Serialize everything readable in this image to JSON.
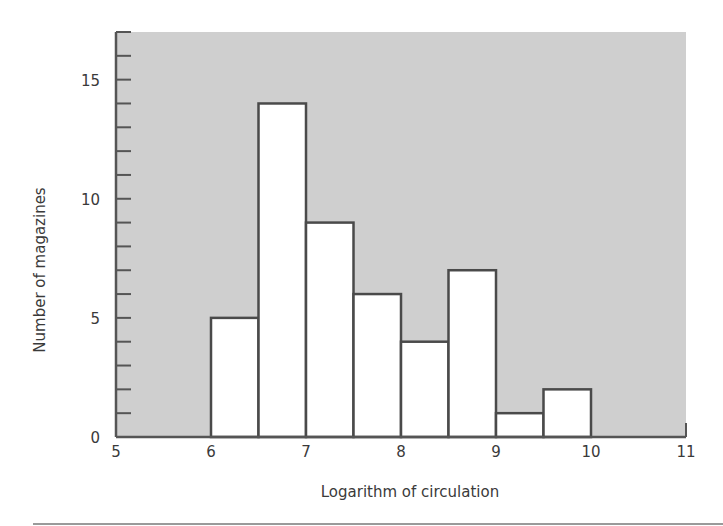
{
  "chart_data": {
    "type": "bar",
    "subtype": "histogram",
    "title": "",
    "xlabel": "Logarithm of circulation",
    "ylabel": "Number of magazines",
    "xlim": [
      5,
      11
    ],
    "ylim": [
      0,
      17
    ],
    "x_ticks": [
      5,
      6,
      7,
      8,
      9,
      10,
      11
    ],
    "y_tick_labels": [
      0,
      5,
      10,
      15
    ],
    "y_minor_tick_step": 1,
    "bin_width": 0.5,
    "bins": [
      {
        "start": 6.0,
        "end": 6.5,
        "count": 5
      },
      {
        "start": 6.5,
        "end": 7.0,
        "count": 14
      },
      {
        "start": 7.0,
        "end": 7.5,
        "count": 9
      },
      {
        "start": 7.5,
        "end": 8.0,
        "count": 6
      },
      {
        "start": 8.0,
        "end": 8.5,
        "count": 4
      },
      {
        "start": 8.5,
        "end": 9.0,
        "count": 7
      },
      {
        "start": 9.0,
        "end": 9.5,
        "count": 1
      },
      {
        "start": 9.5,
        "end": 10.0,
        "count": 2
      }
    ],
    "categories": [
      "6.0-6.5",
      "6.5-7.0",
      "7.0-7.5",
      "7.5-8.0",
      "8.0-8.5",
      "8.5-9.0",
      "9.0-9.5",
      "9.5-10.0"
    ],
    "values": [
      5,
      14,
      9,
      6,
      4,
      7,
      1,
      2
    ],
    "grid": false,
    "legend": null,
    "colors": {
      "plot_background": "#cfcfcf",
      "bar_fill": "#ffffff",
      "bar_edge": "#4a4a4a",
      "axis": "#555555"
    }
  }
}
